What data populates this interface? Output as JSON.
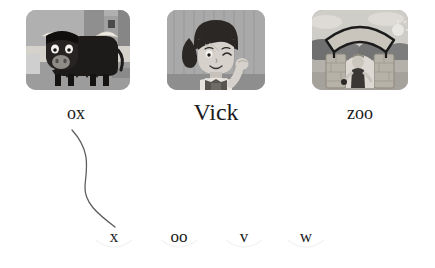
{
  "page": {
    "background_color": "#ffffff",
    "text_color": "#1b1b1b",
    "type": "phonics-matching-worksheet"
  },
  "cards": [
    {
      "id": "card-ox",
      "picture_name": "ox-picture",
      "alt": "black ox with white horns standing in a field",
      "word": "ox",
      "word_font_size": 18,
      "x": 26,
      "y": 10,
      "width": 104,
      "height": 80,
      "label_center_x": 76,
      "label_y": 104
    },
    {
      "id": "card-vick",
      "picture_name": "vick-picture",
      "alt": "girl named Vick winking with her hand raised",
      "word": "Vick",
      "word_font_size": 24,
      "x": 167,
      "y": 10,
      "width": 98,
      "height": 80,
      "label_center_x": 216,
      "label_y": 100
    },
    {
      "id": "card-zoo",
      "picture_name": "zoo-picture",
      "alt": "zoo entrance arch with stone pillars",
      "word": "zoo",
      "word_font_size": 18,
      "x": 312,
      "y": 10,
      "width": 96,
      "height": 80,
      "label_center_x": 360,
      "label_y": 104
    }
  ],
  "graphemes": [
    {
      "id": "grapheme-x",
      "label": "x",
      "center_x": 114,
      "y": 228
    },
    {
      "id": "grapheme-oo",
      "label": "oo",
      "center_x": 179,
      "y": 228
    },
    {
      "id": "grapheme-v",
      "label": "v",
      "center_x": 244,
      "y": 228
    },
    {
      "id": "grapheme-w",
      "label": "w",
      "center_x": 306,
      "y": 228
    }
  ],
  "connector": {
    "name": "ox-to-x-connector",
    "from_word": "ox",
    "to_grapheme": "x",
    "stroke_color": "#5e5e5e",
    "stroke_width": 1.3,
    "path": "M 72,130 C 92,152 86,170 85,186 C 84,203 98,214 115,227"
  },
  "palette": {
    "card_background": "#9a9a9a",
    "ox_body": "#1d1b1a",
    "ox_horn": "#efeae2",
    "sky": "#b9b9b9",
    "grass": "#a5a5a5",
    "line": "#5e5e5e"
  }
}
